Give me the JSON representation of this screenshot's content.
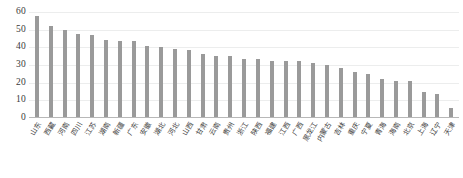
{
  "chart_data": {
    "type": "bar",
    "title": "",
    "subtitle": "",
    "xlabel": "",
    "ylabel": "",
    "ylim": [
      0,
      60
    ],
    "yticks": [
      60,
      50,
      40,
      30,
      20,
      10,
      0
    ],
    "grid": true,
    "legend": null,
    "bar_color": "#9a9a9a",
    "gridline_color": "#eceded",
    "axis_color": "#b8b8b8",
    "categories": [
      "山东",
      "西藏",
      "河南",
      "四川",
      "江苏",
      "湖南",
      "新疆",
      "广东",
      "安徽",
      "湖北",
      "河北",
      "山西",
      "甘肃",
      "云南",
      "贵州",
      "浙江",
      "陕西",
      "福建",
      "江西",
      "广西",
      "黑龙江",
      "内蒙古",
      "吉林",
      "重庆",
      "宁夏",
      "青海",
      "海南",
      "北京",
      "上海",
      "辽宁",
      "天津"
    ],
    "values": [
      58,
      52,
      50,
      47.5,
      47,
      44,
      43.5,
      43.5,
      41,
      40,
      39,
      38.5,
      36.5,
      35,
      35,
      33.5,
      33.5,
      32.5,
      32,
      32,
      31,
      30,
      28.5,
      26,
      25,
      22,
      21,
      21,
      15,
      13.5,
      5.5
    ]
  }
}
